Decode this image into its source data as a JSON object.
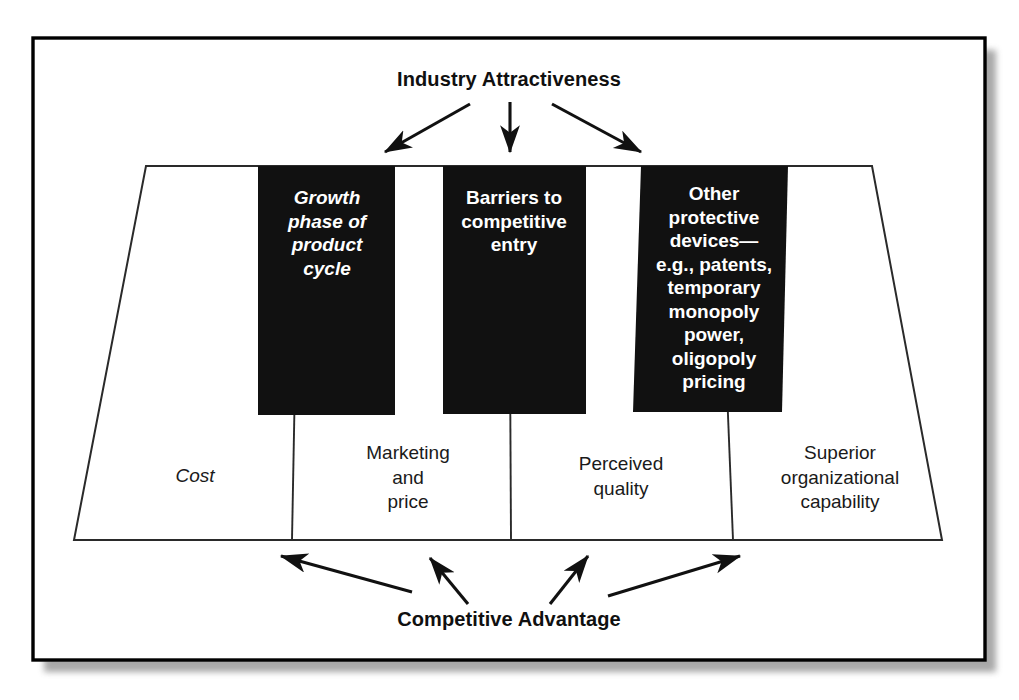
{
  "figure": {
    "top_heading": "Industry Attractiveness",
    "bottom_heading": "Competitive Advantage",
    "colors": {
      "box_fill": "#111111",
      "box_text": "#ffffff",
      "line": "#1a1a1a",
      "frame": "#000000",
      "shadow": "#9a9a9a",
      "background": "#ffffff"
    }
  },
  "black_boxes": [
    {
      "id": "growth-phase",
      "text": "Growth\nphase of\nproduct\ncycle",
      "style": "bold-italic"
    },
    {
      "id": "barriers-entry",
      "text": "Barriers to\ncompetitive\nentry",
      "style": "bold"
    },
    {
      "id": "protective-devices",
      "text": "Other\nprotective\ndevices—\ne.g., patents,\ntemporary\nmonopoly\npower,\noligopoly\npricing",
      "style": "bold"
    }
  ],
  "trapezoid_segments": [
    {
      "id": "cost",
      "text": "Cost",
      "style": "italic"
    },
    {
      "id": "marketing-and-price",
      "text": "Marketing\nand\nprice",
      "style": "regular"
    },
    {
      "id": "perceived-quality",
      "text": "Perceived\nquality",
      "style": "regular"
    },
    {
      "id": "superior-organizational-capability",
      "text": "Superior\norganizational\ncapability",
      "style": "regular"
    }
  ],
  "arrows": {
    "top_count": 3,
    "bottom_count": 4,
    "top_direction": "downward from heading to black boxes",
    "bottom_direction": "upward from heading to trapezoid segments"
  }
}
